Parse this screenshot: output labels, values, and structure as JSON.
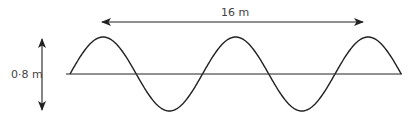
{
  "diagram": {
    "type": "transverse-wave",
    "amplitude_label": "0·8 m",
    "length_label": "16 m",
    "colors": {
      "line": "#222222",
      "text": "#444444",
      "background": "#ffffff"
    },
    "wave": {
      "baseline_y": 74,
      "start_x": 70,
      "period_px": 132.5,
      "cycles": 2.5,
      "peak_y": 37,
      "trough_y": 111
    }
  }
}
